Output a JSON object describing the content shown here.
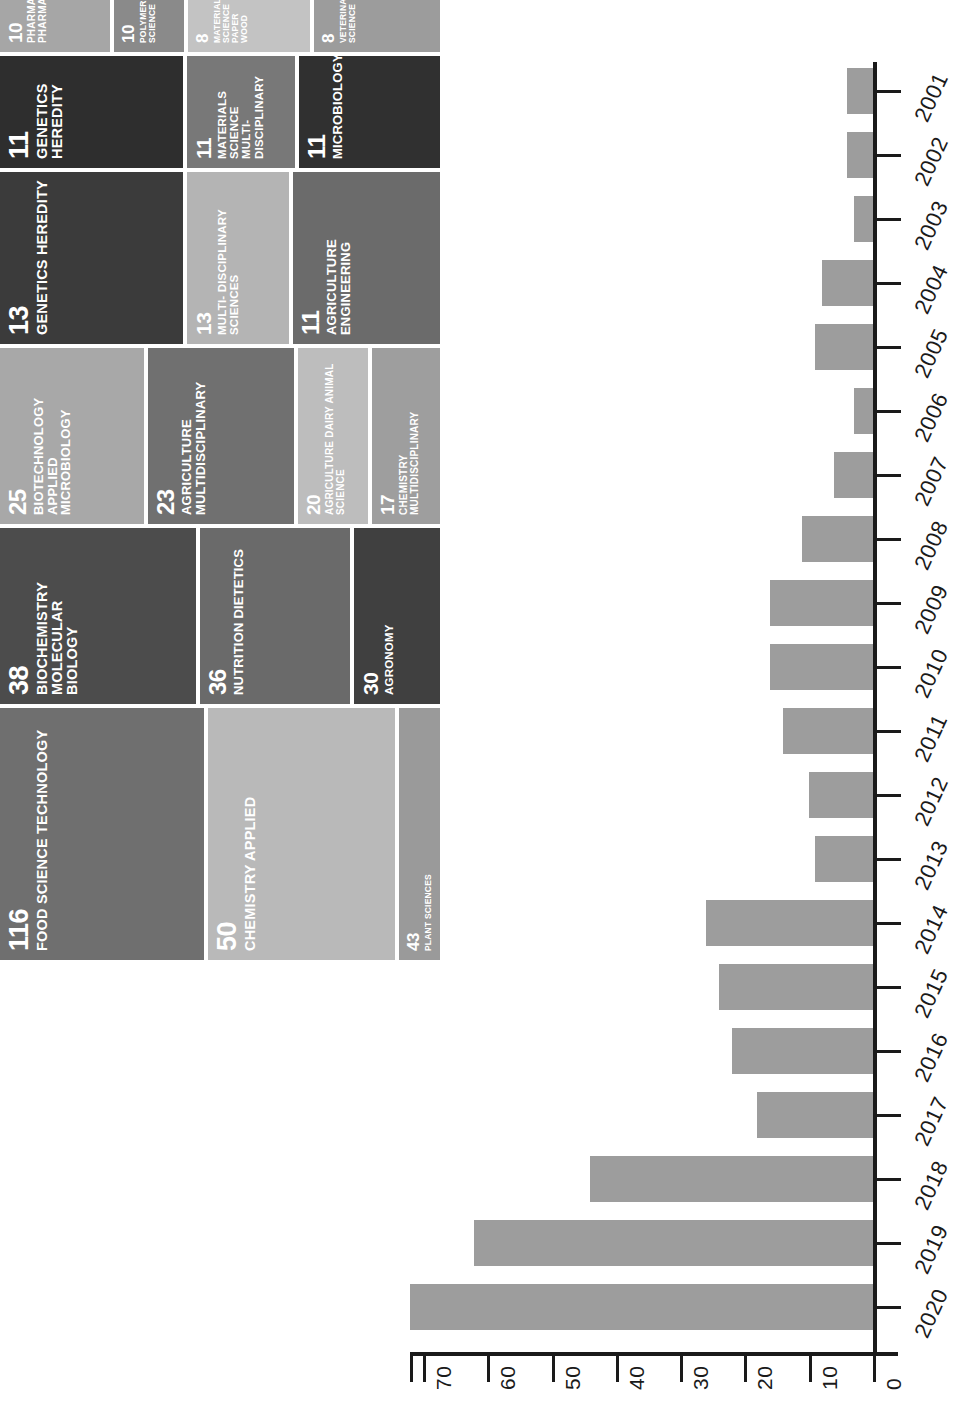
{
  "chart_data": [
    {
      "type": "treemap",
      "title": "",
      "value_unit": "documents",
      "tiles": [
        {
          "value": 116,
          "label": "FOOD SCIENCE TECHNOLOGY",
          "color": "#6f6f6f"
        },
        {
          "value": 50,
          "label": "CHEMISTRY APPLIED",
          "color": "#b9b9b9"
        },
        {
          "value": 43,
          "label": "PLANT SCIENCES",
          "color": "#9a9a9a"
        },
        {
          "value": 38,
          "label": "BIOCHEMISTRY MOLECULAR BIOLOGY",
          "color": "#4c4c4c"
        },
        {
          "value": 36,
          "label": "NUTRITION DIETETICS",
          "color": "#6a6a6a"
        },
        {
          "value": 30,
          "label": "AGRONOMY",
          "color": "#404040"
        },
        {
          "value": 25,
          "label": "BIOTECHNOLOGY APPLIED MICROBIOLOGY",
          "color": "#a8a8a8"
        },
        {
          "value": 23,
          "label": "AGRICULTURE MULTIDISCIPLINARY",
          "color": "#707070"
        },
        {
          "value": 20,
          "label": "AGRICULTURE DAIRY ANIMAL SCIENCE",
          "color": "#bdbdbd"
        },
        {
          "value": 17,
          "label": "CHEMISTRY MULTIDISCIPLINARY",
          "color": "#9e9e9e"
        },
        {
          "value": 13,
          "label": "GENETICS HEREDITY",
          "color": "#3b3b3b"
        },
        {
          "value": 13,
          "label": "MULTI- DISCIPLINARY SCIENCES",
          "color": "#b4b4b4"
        },
        {
          "value": 11,
          "label": "AGRICULTURE ENGINEERING",
          "color": "#6b6b6b"
        },
        {
          "value": 11,
          "label": "GENETICS HEREDITY",
          "color": "#2e2e2e"
        },
        {
          "value": 11,
          "label": "MATERIALS SCIENCE MULTI- DISCIPLINARY",
          "color": "#787878"
        },
        {
          "value": 11,
          "label": "MICROBIOLOGY",
          "color": "#303030"
        },
        {
          "value": 10,
          "label": "PHARMACOLOGY PHARMACY",
          "color": "#a6a6a6"
        },
        {
          "value": 10,
          "label": "POLYMER SCIENCE",
          "color": "#8a8a8a"
        },
        {
          "value": 8,
          "label": "MATERIALS SCIENCE PAPER WOOD",
          "color": "#c3c3c3"
        },
        {
          "value": 8,
          "label": "VETERINARY SCIENCE",
          "color": "#9c9c9c"
        }
      ]
    },
    {
      "type": "bar",
      "orientation": "horizontal",
      "title": "",
      "xlabel": "",
      "ylabel": "",
      "categories": [
        "2001",
        "2002",
        "2003",
        "2004",
        "2005",
        "2006",
        "2007",
        "2008",
        "2009",
        "2010",
        "2011",
        "2012",
        "2013",
        "2014",
        "2015",
        "2016",
        "2017",
        "2018",
        "2019",
        "2020"
      ],
      "values": [
        4,
        4,
        3,
        8,
        9,
        3,
        6,
        11,
        16,
        16,
        14,
        10,
        9,
        26,
        24,
        22,
        18,
        44,
        62,
        72
      ],
      "axis_ticks": [
        0,
        10,
        20,
        30,
        40,
        50,
        60,
        70
      ],
      "xlim": [
        0,
        75
      ],
      "grid": false,
      "bar_color": "#9d9d9d",
      "axis_color": "#1a1a1a"
    }
  ]
}
